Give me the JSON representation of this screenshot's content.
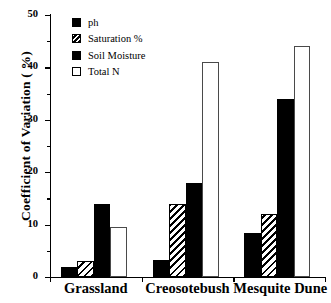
{
  "chart_data": {
    "type": "bar",
    "title": "",
    "xlabel": "",
    "ylabel": "Coefficient of Variation ( %)",
    "ylim": [
      0,
      50
    ],
    "yticks": [
      0,
      10,
      20,
      30,
      40,
      50
    ],
    "yminorticks": [
      5,
      15,
      25,
      35,
      45
    ],
    "grid": false,
    "legend_position": "top-left",
    "categories": [
      "Grassland",
      "Creosotebush",
      "Mesquite Dune"
    ],
    "series": [
      {
        "name": "ph",
        "fill": "solid",
        "values": [
          2.0,
          3.3,
          8.4
        ]
      },
      {
        "name": "Saturation %",
        "fill": "hatch",
        "values": [
          3.0,
          14.0,
          12.0
        ]
      },
      {
        "name": "Soil Moisture",
        "fill": "solid",
        "values": [
          14.0,
          18.0,
          34.0
        ]
      },
      {
        "name": "Total N",
        "fill": "open",
        "values": [
          9.5,
          41.0,
          44.0
        ]
      }
    ]
  },
  "colors": {
    "solid": "#000000",
    "open_outline": "#4a4a4a",
    "axis": "#000000",
    "background": "#ffffff"
  }
}
